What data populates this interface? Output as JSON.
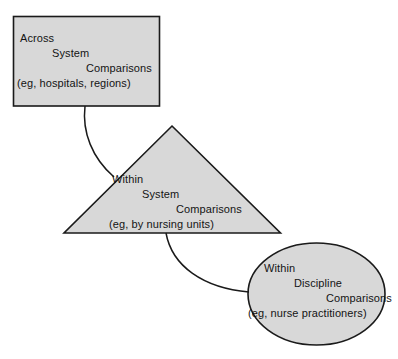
{
  "diagram": {
    "colors": {
      "shape_fill": "#d8d8d8",
      "shape_stroke": "#1a1a1a",
      "background": "#ffffff",
      "text": "#141414"
    },
    "nodes": [
      {
        "id": "across-system-comparisons",
        "shape": "rectangle",
        "lines": [
          "Across",
          "System",
          "Comparisons",
          "(eg, hospitals, regions)"
        ]
      },
      {
        "id": "within-system-comparisons",
        "shape": "triangle",
        "lines": [
          "Within",
          "System",
          "Comparisons",
          "(eg, by nursing units)"
        ]
      },
      {
        "id": "within-discipline-comparisons",
        "shape": "ellipse",
        "lines": [
          "Within",
          "Discipline",
          "Comparisons",
          "(eg, nurse practitioners)"
        ]
      }
    ],
    "connectors": [
      {
        "id": "rectangle-to-triangle",
        "from": "across-system-comparisons",
        "to": "within-system-comparisons"
      },
      {
        "id": "triangle-to-ellipse",
        "from": "within-system-comparisons",
        "to": "within-discipline-comparisons"
      }
    ]
  }
}
